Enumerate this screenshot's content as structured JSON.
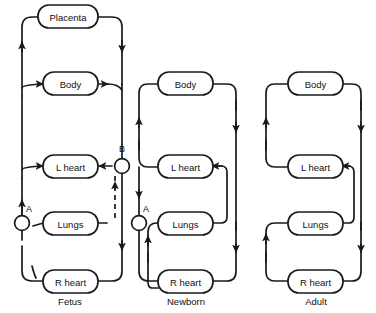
{
  "figure": {
    "background_color": "#ffffff",
    "line_color": "#1a1a1a"
  },
  "panels": [
    {
      "id": "fetus",
      "label": "Fetus",
      "nodes": [
        {
          "id": "placenta",
          "label": "Placenta"
        },
        {
          "id": "body",
          "label": "Body"
        },
        {
          "id": "l-heart",
          "label": "L heart"
        },
        {
          "id": "lungs",
          "label": "Lungs"
        },
        {
          "id": "r-heart",
          "label": "R heart"
        }
      ],
      "markers": [
        {
          "id": "a",
          "label": "A"
        },
        {
          "id": "b",
          "label": "B"
        }
      ]
    },
    {
      "id": "newborn",
      "label": "Newborn",
      "nodes": [
        {
          "id": "body",
          "label": "Body"
        },
        {
          "id": "l-heart",
          "label": "L heart"
        },
        {
          "id": "lungs",
          "label": "Lungs"
        },
        {
          "id": "r-heart",
          "label": "R heart"
        }
      ],
      "markers": [
        {
          "id": "a",
          "label": "A"
        }
      ]
    },
    {
      "id": "adult",
      "label": "Adult",
      "nodes": [
        {
          "id": "body",
          "label": "Body"
        },
        {
          "id": "l-heart",
          "label": "L heart"
        },
        {
          "id": "lungs",
          "label": "Lungs"
        },
        {
          "id": "r-heart",
          "label": "R heart"
        }
      ],
      "markers": []
    }
  ]
}
